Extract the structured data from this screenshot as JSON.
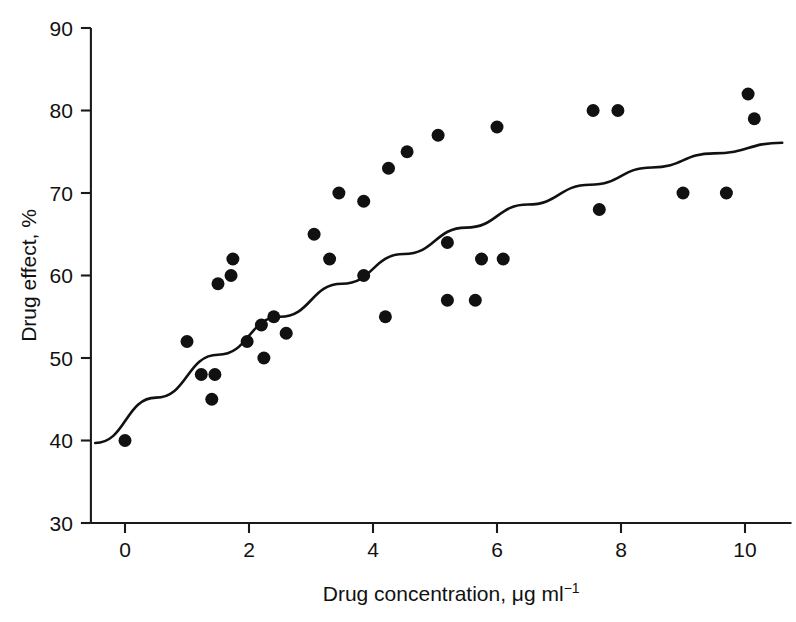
{
  "chart_data": {
    "type": "scatter",
    "title": "",
    "xlabel": "Drug concentration, μg ml⁻¹",
    "xlabel_base": "Drug concentration, μg ml",
    "xlabel_exponent": "−1",
    "ylabel": "Drug effect, %",
    "xlim": [
      -0.55,
      10.75
    ],
    "ylim": [
      30,
      90
    ],
    "xticks": [
      0,
      2,
      4,
      6,
      8,
      10
    ],
    "xtick_labels": [
      "0",
      "2",
      "4",
      "6",
      "8",
      "10"
    ],
    "yticks": [
      30,
      40,
      50,
      60,
      70,
      80,
      90
    ],
    "ytick_labels": [
      "30",
      "40",
      "50",
      "60",
      "70",
      "80",
      "90"
    ],
    "grid": false,
    "legend": null,
    "marker": "filled-circle",
    "marker_color": "#111111",
    "marker_size_px": 13,
    "curve_color": "#111111",
    "points": [
      {
        "x": 0.0,
        "y": 40
      },
      {
        "x": 1.0,
        "y": 52
      },
      {
        "x": 1.23,
        "y": 48
      },
      {
        "x": 1.45,
        "y": 48
      },
      {
        "x": 1.4,
        "y": 45
      },
      {
        "x": 1.5,
        "y": 59
      },
      {
        "x": 1.71,
        "y": 60
      },
      {
        "x": 1.74,
        "y": 62
      },
      {
        "x": 1.97,
        "y": 52
      },
      {
        "x": 2.2,
        "y": 54
      },
      {
        "x": 2.24,
        "y": 50
      },
      {
        "x": 2.4,
        "y": 55
      },
      {
        "x": 2.6,
        "y": 53
      },
      {
        "x": 3.05,
        "y": 65
      },
      {
        "x": 3.3,
        "y": 62
      },
      {
        "x": 3.45,
        "y": 70
      },
      {
        "x": 3.85,
        "y": 69
      },
      {
        "x": 3.85,
        "y": 60
      },
      {
        "x": 4.2,
        "y": 55
      },
      {
        "x": 4.25,
        "y": 73
      },
      {
        "x": 4.55,
        "y": 75
      },
      {
        "x": 5.05,
        "y": 77
      },
      {
        "x": 5.2,
        "y": 64
      },
      {
        "x": 5.2,
        "y": 57
      },
      {
        "x": 5.65,
        "y": 57
      },
      {
        "x": 5.75,
        "y": 62
      },
      {
        "x": 6.0,
        "y": 78
      },
      {
        "x": 6.1,
        "y": 62
      },
      {
        "x": 7.55,
        "y": 80
      },
      {
        "x": 7.65,
        "y": 68
      },
      {
        "x": 7.95,
        "y": 80
      },
      {
        "x": 9.0,
        "y": 70
      },
      {
        "x": 9.7,
        "y": 70
      },
      {
        "x": 10.05,
        "y": 82
      },
      {
        "x": 10.15,
        "y": 79
      }
    ],
    "fit_curve": {
      "name": "fitted curve",
      "x": [
        -0.48,
        0.5,
        1.5,
        2.5,
        3.5,
        4.5,
        5.5,
        6.5,
        7.5,
        8.5,
        9.5,
        10.6
      ],
      "y": [
        39.7,
        45.2,
        50.4,
        55.0,
        59.0,
        62.6,
        65.8,
        68.6,
        71.0,
        73.1,
        74.8,
        76.1
      ]
    }
  }
}
